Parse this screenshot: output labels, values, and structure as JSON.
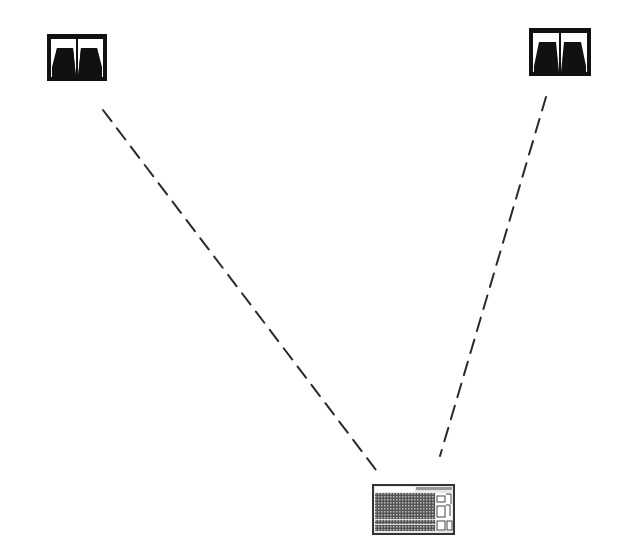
{
  "diagram": {
    "type": "stereo-listening-setup",
    "background": "#ffffff",
    "stroke_color": "#222222",
    "nodes": [
      {
        "id": "speaker-left",
        "icon": "speaker-icon",
        "x": 47,
        "y": 34,
        "w": 60,
        "h": 47
      },
      {
        "id": "speaker-right",
        "icon": "speaker-icon",
        "x": 529,
        "y": 28,
        "w": 62,
        "h": 48
      },
      {
        "id": "mixer",
        "icon": "mixing-console-icon",
        "x": 372,
        "y": 484,
        "w": 83,
        "h": 51
      }
    ],
    "connections": [
      {
        "from": "speaker-left",
        "to": "mixer",
        "style": "dashed",
        "x1": 103,
        "y1": 110,
        "x2": 376,
        "y2": 470
      },
      {
        "from": "speaker-right",
        "to": "mixer",
        "style": "dashed",
        "x1": 546,
        "y1": 97,
        "x2": 440,
        "y2": 456
      }
    ]
  }
}
